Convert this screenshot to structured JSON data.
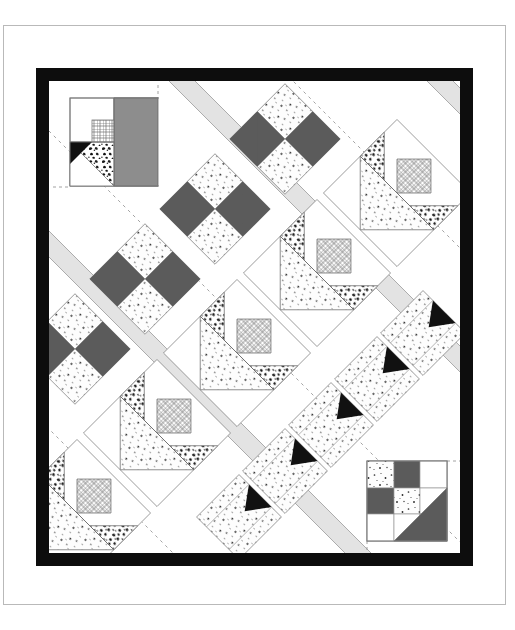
{
  "document": {
    "type": "quilt-pattern-diagram",
    "title": "Diagonal Set Quilt Layout Diagram",
    "page_border_color": "#b9b9b9",
    "background_color": "#ffffff"
  },
  "quilt": {
    "border": {
      "name": "outer-border",
      "color": "#0d0d0d",
      "width_px": 13
    },
    "interior": {
      "background_color": "#ffffff",
      "width_px": 411,
      "height_px": 472
    },
    "sashing": {
      "name": "diagonal-sashing-strips",
      "color": "#e2e2e2",
      "outline_color": "#9a9a9a",
      "angle_deg": 45,
      "strip_width_px": 26,
      "count": 5,
      "guide_line_color": "#8f8f8f",
      "guide_line_style": "dashed"
    },
    "palette": {
      "dark_gray": "#5b5b5b",
      "black": "#111111",
      "medium_gray": "#8d8d8d",
      "light_gray": "#e2e2e2",
      "speckle_light": "#fdfdfd",
      "speckle_dot": "#3a3a3a",
      "grid_fabric": "#ffffff",
      "grid_line": "#6e6e6e",
      "mottled_dark": "#1d1d1d",
      "outline": "#7a7a7a",
      "white": "#ffffff"
    },
    "blocks": [
      {
        "id": "corner-detail-top-left",
        "name": "corner-detail-block-top-left",
        "type": "basket-corner-detail",
        "orientation": "axis-aligned",
        "x": 21,
        "y": 17,
        "size": 88,
        "parts": [
          "grid-square",
          "mottled-triangle",
          "speckle-triangle",
          "gray-large-triangle"
        ]
      },
      {
        "id": "fourpatch-1",
        "name": "four-patch-block",
        "type": "four-patch",
        "orientation": "on-point",
        "cx": 236,
        "cy": 58,
        "size": 78
      },
      {
        "id": "fourpatch-2",
        "name": "four-patch-block",
        "type": "four-patch",
        "orientation": "on-point",
        "cx": 166,
        "cy": 128,
        "size": 78
      },
      {
        "id": "fourpatch-3",
        "name": "four-patch-block",
        "type": "four-patch",
        "orientation": "on-point",
        "cx": 96,
        "cy": 198,
        "size": 78
      },
      {
        "id": "fourpatch-4",
        "name": "four-patch-block",
        "type": "four-patch",
        "orientation": "on-point",
        "cx": 26,
        "cy": 268,
        "size": 78
      },
      {
        "id": "basket-1",
        "name": "basket-block",
        "type": "basket",
        "orientation": "on-point",
        "cx": 348,
        "cy": 112,
        "size": 104
      },
      {
        "id": "basket-2",
        "name": "basket-block",
        "type": "basket",
        "orientation": "on-point",
        "cx": 268,
        "cy": 192,
        "size": 104
      },
      {
        "id": "basket-3",
        "name": "basket-block",
        "type": "basket",
        "orientation": "on-point",
        "cx": 188,
        "cy": 272,
        "size": 104
      },
      {
        "id": "basket-4",
        "name": "basket-block",
        "type": "basket",
        "orientation": "on-point",
        "cx": 108,
        "cy": 352,
        "size": 104
      },
      {
        "id": "basket-5",
        "name": "basket-block",
        "type": "basket",
        "orientation": "on-point",
        "cx": 28,
        "cy": 432,
        "size": 104
      },
      {
        "id": "tulip-1",
        "name": "tulip-block",
        "type": "tulip",
        "orientation": "on-point",
        "cx": 374,
        "cy": 252,
        "size": 60
      },
      {
        "id": "tulip-2",
        "name": "tulip-block",
        "type": "tulip",
        "orientation": "on-point",
        "cx": 328,
        "cy": 298,
        "size": 60
      },
      {
        "id": "tulip-3",
        "name": "tulip-block",
        "type": "tulip",
        "orientation": "on-point",
        "cx": 282,
        "cy": 344,
        "size": 60
      },
      {
        "id": "tulip-4",
        "name": "tulip-block",
        "type": "tulip",
        "orientation": "on-point",
        "cx": 236,
        "cy": 390,
        "size": 60
      },
      {
        "id": "tulip-5",
        "name": "tulip-block",
        "type": "tulip",
        "orientation": "on-point",
        "cx": 190,
        "cy": 436,
        "size": 60
      },
      {
        "id": "corner-detail-bottom-right",
        "name": "corner-detail-block-bottom-right",
        "type": "nine-patch-corner-detail",
        "orientation": "axis-aligned",
        "x": 318,
        "y": 380,
        "size": 80,
        "parts": [
          "speckle-square",
          "dark-square",
          "white-square",
          "dark-half-triangle"
        ]
      }
    ],
    "legend_note": null
  }
}
